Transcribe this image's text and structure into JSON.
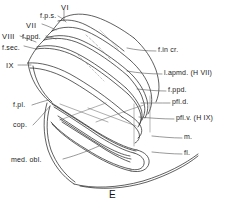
{
  "figure": {
    "panel_letter": "E",
    "caption_type": "anatomical line drawing of cerebellum, lateral view",
    "ink_color": "#262626",
    "background_color": "#ffffff"
  },
  "annotations": {
    "left": [
      {
        "key": "f_p_s",
        "label": "f.p.s.",
        "x": 40,
        "y": 12,
        "style": "plain"
      },
      {
        "key": "vi",
        "label": "VI",
        "x": 61,
        "y": 4,
        "style": "roman"
      },
      {
        "key": "vii",
        "label": "VII",
        "x": 26,
        "y": 22,
        "style": "roman"
      },
      {
        "key": "f_ppd",
        "label": "f.ppd.",
        "x": 22,
        "y": 33,
        "style": "plain"
      },
      {
        "key": "viii",
        "label": "VIII",
        "x": 2,
        "y": 33,
        "style": "roman"
      },
      {
        "key": "f_sec",
        "label": "f.sec.",
        "x": 2,
        "y": 44,
        "style": "plain"
      },
      {
        "key": "ix",
        "label": "IX",
        "x": 6,
        "y": 63,
        "style": "roman"
      },
      {
        "key": "f_pl",
        "label": "f.pl.",
        "x": 13,
        "y": 104,
        "style": "plain"
      },
      {
        "key": "cop",
        "label": "cop.",
        "x": 13,
        "y": 124,
        "style": "plain"
      },
      {
        "key": "med_obl",
        "label": "med. obl.",
        "x": 11,
        "y": 159,
        "style": "plain"
      }
    ],
    "right": [
      {
        "key": "f_in_cr",
        "label": "f.in cr.",
        "x": 158,
        "y": 49,
        "style": "plain"
      },
      {
        "key": "l_apmd",
        "label": "l.apmd. (H VII)",
        "x": 164,
        "y": 72,
        "style": "plain"
      },
      {
        "key": "f_ppd_r",
        "label": "f.ppd.",
        "x": 168,
        "y": 89,
        "style": "plain"
      },
      {
        "key": "pfl_d",
        "label": "pfl.d.",
        "x": 172,
        "y": 101,
        "style": "plain"
      },
      {
        "key": "pfl_v",
        "label": "pfl.v. (H IX)",
        "x": 176,
        "y": 117,
        "style": "plain"
      },
      {
        "key": "m",
        "label": "m.",
        "x": 184,
        "y": 136,
        "style": "plain"
      },
      {
        "key": "fl",
        "label": "fl.",
        "x": 184,
        "y": 152,
        "style": "plain"
      }
    ]
  }
}
